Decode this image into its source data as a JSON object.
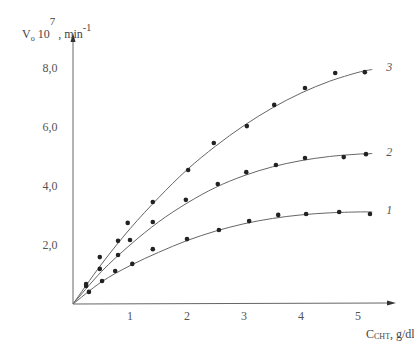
{
  "chart_data": {
    "type": "scatter",
    "title": "",
    "xlabel": "C_CHT, g/dl",
    "xlabel_main": "C",
    "xlabel_sub": "CHT",
    "xlabel_unit": ", g/dl",
    "ylabel": "V₀ 10^7, min^-1",
    "ylabel_parts": {
      "v": "V",
      "sub": "o",
      "ten": " 10",
      "exp": "7",
      "unit": " , min",
      "unit_exp": "-1"
    },
    "xlim": [
      0,
      5.5
    ],
    "ylim": [
      0,
      9.0
    ],
    "x_ticks": [
      "1",
      "2",
      "3",
      "4",
      "5"
    ],
    "y_ticks": [
      "2,0",
      "4,0",
      "6,0",
      "8,0"
    ],
    "grid": false,
    "legend": "inline curve labels at right end",
    "series": [
      {
        "name": "1",
        "label": "1",
        "points": [
          [
            0.28,
            0.41
          ],
          [
            0.51,
            0.78
          ],
          [
            0.74,
            1.12
          ],
          [
            1.04,
            1.36
          ],
          [
            1.4,
            1.86
          ],
          [
            2.0,
            2.2
          ],
          [
            2.56,
            2.51
          ],
          [
            3.09,
            2.81
          ],
          [
            3.6,
            3.02
          ],
          [
            4.09,
            3.05
          ],
          [
            4.67,
            3.12
          ],
          [
            5.21,
            3.05
          ]
        ],
        "fit": [
          [
            0,
            0
          ],
          [
            0.5,
            0.75
          ],
          [
            1.0,
            1.3
          ],
          [
            1.5,
            1.75
          ],
          [
            2.0,
            2.15
          ],
          [
            2.5,
            2.47
          ],
          [
            3.0,
            2.72
          ],
          [
            3.5,
            2.9
          ],
          [
            4.0,
            3.02
          ],
          [
            4.5,
            3.09
          ],
          [
            5.0,
            3.12
          ],
          [
            5.25,
            3.12
          ]
        ]
      },
      {
        "name": "2",
        "label": "2",
        "points": [
          [
            0.23,
            0.61
          ],
          [
            0.47,
            1.19
          ],
          [
            0.79,
            1.66
          ],
          [
            1.0,
            2.17
          ],
          [
            1.4,
            2.78
          ],
          [
            1.98,
            3.53
          ],
          [
            2.54,
            4.07
          ],
          [
            3.04,
            4.47
          ],
          [
            3.56,
            4.71
          ],
          [
            4.07,
            4.95
          ],
          [
            4.75,
            4.98
          ],
          [
            5.14,
            5.08
          ]
        ],
        "fit": [
          [
            0,
            0
          ],
          [
            0.5,
            1.1
          ],
          [
            1.0,
            2.0
          ],
          [
            1.5,
            2.78
          ],
          [
            2.0,
            3.42
          ],
          [
            2.5,
            3.95
          ],
          [
            3.0,
            4.35
          ],
          [
            3.5,
            4.65
          ],
          [
            4.0,
            4.86
          ],
          [
            4.5,
            5.0
          ],
          [
            5.0,
            5.08
          ],
          [
            5.25,
            5.1
          ]
        ]
      },
      {
        "name": "3",
        "label": "3",
        "points": [
          [
            0.23,
            0.68
          ],
          [
            0.47,
            1.59
          ],
          [
            0.79,
            2.14
          ],
          [
            0.96,
            2.75
          ],
          [
            1.4,
            3.46
          ],
          [
            2.02,
            4.54
          ],
          [
            2.47,
            5.46
          ],
          [
            3.05,
            6.03
          ],
          [
            3.53,
            6.75
          ],
          [
            4.07,
            7.32
          ],
          [
            4.6,
            7.83
          ],
          [
            5.12,
            7.86
          ]
        ],
        "fit": [
          [
            0,
            0
          ],
          [
            0.5,
            1.35
          ],
          [
            1.0,
            2.55
          ],
          [
            1.5,
            3.6
          ],
          [
            2.0,
            4.55
          ],
          [
            2.5,
            5.35
          ],
          [
            3.0,
            6.05
          ],
          [
            3.5,
            6.65
          ],
          [
            4.0,
            7.15
          ],
          [
            4.5,
            7.55
          ],
          [
            5.0,
            7.85
          ],
          [
            5.25,
            7.95
          ]
        ]
      }
    ]
  }
}
